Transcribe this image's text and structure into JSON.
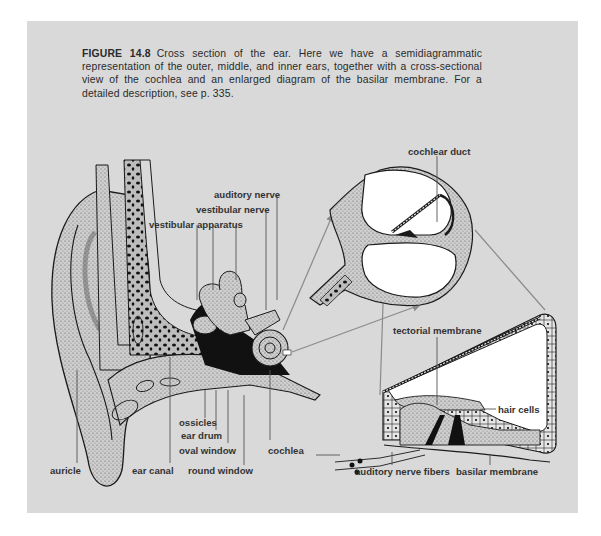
{
  "figure": {
    "number": "FIGURE 14.8",
    "caption": "Cross section of the ear. Here we have a semidiagrammatic representation of the outer, middle, and inner ears, together with a cross-sectional view of the cochlea and an enlarged diagram of the basilar membrane. For a detailed description, see p. 335."
  },
  "labels": {
    "auditory_nerve": "auditory nerve",
    "vestibular_nerve": "vestibular nerve",
    "vestibular_apparatus": "vestibular apparatus",
    "ossicles": "ossicles",
    "ear_drum": "ear drum",
    "oval_window": "oval window",
    "round_window": "round window",
    "cochlea": "cochlea",
    "auricle": "auricle",
    "ear_canal": "ear canal",
    "cochlear_duct": "cochlear duct",
    "tectorial_membrane": "tectorial membrane",
    "hair_cells": "hair cells",
    "auditory_nerve_fibers": "auditory nerve fibers",
    "basilar_membrane": "basilar membrane"
  },
  "colors": {
    "panel": "#d9d9d9",
    "ink": "#1a1a1a",
    "leader": "#555555",
    "arrow": "#8a8a8a"
  }
}
